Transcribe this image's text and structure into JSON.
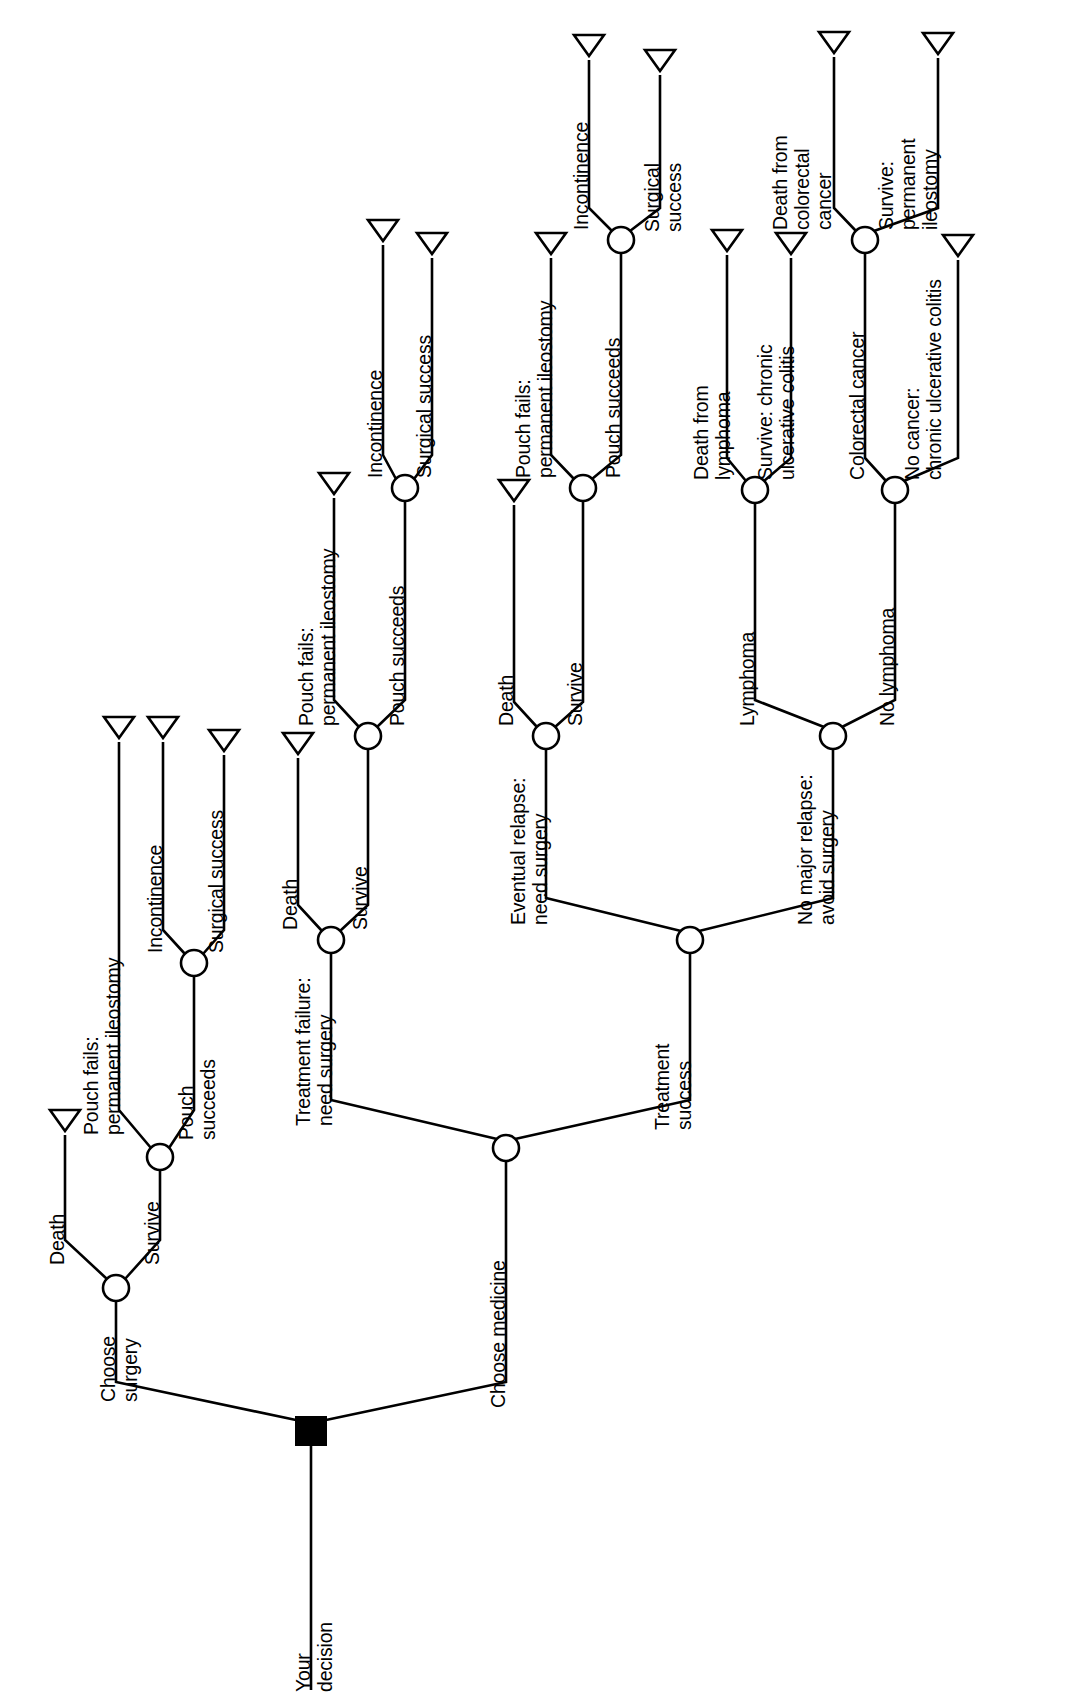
{
  "diagram": {
    "type": "decision-tree",
    "orientation": "rotated-90-counterclockwise",
    "root_label": "Your\ndecision",
    "node_shapes": {
      "decision": "filled-black-square",
      "chance": "open-circle",
      "terminal": "open-triangle"
    },
    "colors": {
      "line": "#000000",
      "fill": "#ffffff",
      "decision_fill": "#000000",
      "background": "#ffffff"
    }
  },
  "labels": {
    "root": "Your\ndecision",
    "choose_surgery": "Choose\nsurgery",
    "choose_medicine": "Choose medicine",
    "s_death": "Death",
    "s_survive": "Survive",
    "s_pouch_fails": "Pouch fails:\npermanent ileostomy",
    "s_pouch_succeeds": "Pouch\nsucceeds",
    "s_incontinence": "Incontinence",
    "s_surgical_success": "Surgical success",
    "m_treatment_failure": "Treatment failure:\nneed surgery",
    "m_treatment_success": "Treatment\nsuccess",
    "tf_death": "Death",
    "tf_survive": "Survive",
    "tf_pouch_fails": "Pouch fails:\npermanent ileostomy",
    "tf_pouch_succeeds": "Pouch succeeds",
    "tf_incontinence": "Incontinence",
    "tf_surgical_success": "Surgical success",
    "ts_relapse": "Eventual relapse:\nneed surgery",
    "ts_no_relapse": "No major relapse:\navoid surgery",
    "rel_death": "Death",
    "rel_survive": "Survive",
    "rel_pouch_fails": "Pouch fails:\npermanent ileostomy",
    "rel_pouch_succeeds": "Pouch succeeds",
    "rel_incontinence": "Incontinence",
    "rel_surgical_success": "Surgical\nsuccess",
    "nr_lymphoma": "Lymphoma",
    "nr_no_lymphoma": "No lymphoma",
    "ly_death": "Death from\nlymphoma",
    "ly_survive": "Survive: chronic\nulcerative colitis",
    "nl_colorectal": "Colorectal cancer",
    "nl_no_cancer": "No cancer:\nchronic ulcerative colitis",
    "cc_death": "Death from\ncolorectal\ncancer",
    "cc_survive": "Survive:\npermanent\nileostomy"
  }
}
